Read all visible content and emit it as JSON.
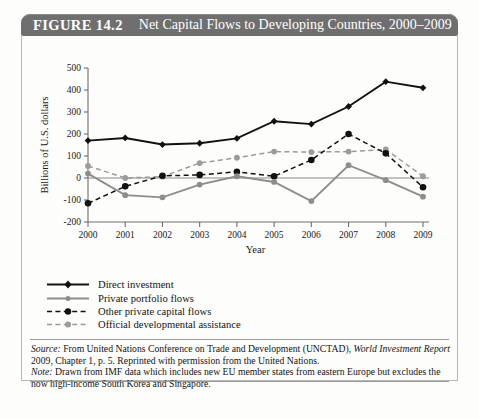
{
  "header": {
    "figure_label": "FIGURE 14.2",
    "title": "Net Capital Flows to Developing Countries, 2000–2009",
    "bar_color": "#6f6f6f",
    "text_color": "#ffffff"
  },
  "legend": {
    "items": [
      {
        "label": "Direct investment",
        "style": "solid",
        "color": "#111111",
        "marker": "diamond"
      },
      {
        "label": "Private portfolio flows",
        "style": "solid",
        "color": "#8d8d8d",
        "marker": "circle"
      },
      {
        "label": "Other private capital flows",
        "style": "dashed",
        "color": "#111111",
        "marker": "circle"
      },
      {
        "label": "Official developmental assistance",
        "style": "dashed",
        "color": "#9b9b9b",
        "marker": "circle"
      }
    ]
  },
  "notes": {
    "source_label": "Source:",
    "source_text_1": " From United Nations Conference on Trade and Development (UNCTAD), ",
    "source_italic": "World Investment Report",
    "source_text_2": " 2009, Chapter 1, p. 5. Reprinted with permission from the United Nations.",
    "note_label": "Note:",
    "note_text": " Drawn from IMF data which includes new EU member states from eastern Europe but excludes the now high-income South Korea and Singapore."
  },
  "chart_data": {
    "type": "line",
    "title": "Net Capital Flows to Developing Countries, 2000–2009",
    "xlabel": "Year",
    "ylabel": "Billions of U.S. dollars",
    "categories": [
      "2000",
      "2001",
      "2002",
      "2003",
      "2004",
      "2005",
      "2006",
      "2007",
      "2008",
      "2009"
    ],
    "x": [
      2000,
      2001,
      2002,
      2003,
      2004,
      2005,
      2006,
      2007,
      2008,
      2009
    ],
    "ylim": [
      -200,
      500
    ],
    "yticks": [
      -200,
      -100,
      0,
      100,
      200,
      300,
      400,
      500
    ],
    "ytick_labels": [
      "-200",
      "-100",
      "0",
      "100",
      "200",
      "300",
      "400",
      "500"
    ],
    "grid": false,
    "legend_position": "below-plot-left",
    "series": [
      {
        "name": "Direct investment",
        "color": "#111111",
        "linestyle": "solid",
        "marker": "diamond",
        "values": [
          170,
          182,
          152,
          158,
          180,
          258,
          245,
          325,
          438,
          410
        ]
      },
      {
        "name": "Private portfolio flows",
        "color": "#8d8d8d",
        "linestyle": "solid",
        "marker": "circle",
        "values": [
          20,
          -78,
          -88,
          -30,
          8,
          -18,
          -105,
          58,
          -10,
          -85
        ]
      },
      {
        "name": "Other private capital flows",
        "color": "#111111",
        "linestyle": "dashed",
        "marker": "circle",
        "values": [
          -115,
          -38,
          10,
          14,
          28,
          8,
          82,
          200,
          112,
          -42
        ]
      },
      {
        "name": "Official developmental assistance",
        "color": "#9b9b9b",
        "linestyle": "dashed",
        "marker": "circle",
        "values": [
          55,
          0,
          6,
          68,
          92,
          120,
          118,
          120,
          130,
          8
        ]
      }
    ]
  }
}
